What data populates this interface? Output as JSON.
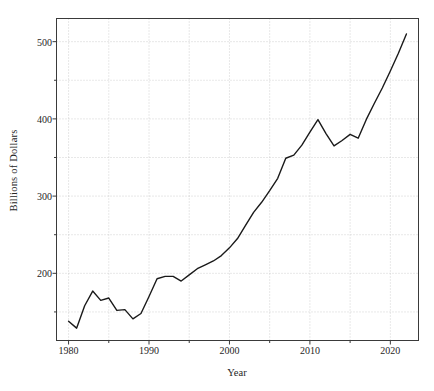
{
  "chart_data": {
    "type": "line",
    "title": "",
    "xlabel": "Year",
    "ylabel": "Billions of Dollars",
    "xlim": [
      1978.5,
      2023.5
    ],
    "ylim": [
      113,
      530
    ],
    "xticks": [
      1980,
      1990,
      2000,
      2010,
      2020
    ],
    "xtick_labels": [
      "1980",
      "1990",
      "2000",
      "2010",
      "2020"
    ],
    "yticks": [
      200,
      300,
      400,
      500
    ],
    "ytick_labels": [
      "200",
      "300",
      "400",
      "500"
    ],
    "minor_yticks": [
      150,
      250,
      350,
      450
    ],
    "minor_xticks": [
      1985,
      1995,
      2005,
      2015
    ],
    "grid": true,
    "grid_style": "dotted",
    "legend": null,
    "line_color": "#1a1a1a",
    "line_width": 1.4,
    "series": [
      {
        "name": "Billions of Dollars",
        "x": [
          1980,
          1981,
          1982,
          1983,
          1984,
          1985,
          1986,
          1987,
          1988,
          1989,
          1990,
          1991,
          1992,
          1993,
          1994,
          1995,
          1996,
          1997,
          1998,
          1999,
          2000,
          2001,
          2002,
          2003,
          2004,
          2005,
          2006,
          2007,
          2008,
          2009,
          2010,
          2011,
          2012,
          2013,
          2014,
          2015,
          2016,
          2017,
          2018,
          2019,
          2020,
          2021,
          2022
        ],
        "values": [
          138,
          129,
          158,
          177,
          165,
          168,
          152,
          153,
          141,
          148,
          170,
          193,
          196,
          196,
          190,
          198,
          206,
          211,
          216,
          223,
          233,
          245,
          262,
          279,
          292,
          307,
          323,
          349,
          353,
          366,
          383,
          399,
          381,
          365,
          372,
          380,
          375,
          399,
          420,
          440,
          462,
          485,
          510
        ]
      }
    ]
  },
  "axes": {
    "y_label_text": "Billions of Dollars",
    "x_label_text": "Year"
  }
}
